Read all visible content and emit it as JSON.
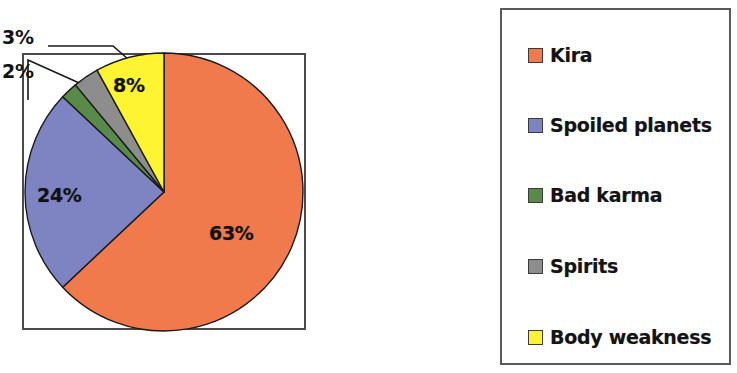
{
  "chart_data": {
    "type": "pie",
    "title": "",
    "subtitle": "",
    "xlabel": "",
    "ylabel": "",
    "legend_position": "right",
    "grid": false,
    "categories": [
      "Kira",
      "Spoiled planets",
      "Bad karma",
      "Spirits",
      "Body weakness"
    ],
    "values": [
      63,
      24,
      2,
      3,
      8
    ],
    "value_labels": [
      "63%",
      "24%",
      "2%",
      "3%",
      "8%"
    ],
    "colors": [
      "#f07a4c",
      "#7e84c2",
      "#5a8a4a",
      "#8d8d8d",
      "#fff432"
    ],
    "units": "percent",
    "slices": [
      {
        "label": "Kira",
        "value": 63,
        "display": "63%",
        "color": "#f07a4c",
        "label_placement": "inside"
      },
      {
        "label": "Spoiled planets",
        "value": 24,
        "display": "24%",
        "color": "#7e84c2",
        "label_placement": "inside"
      },
      {
        "label": "Bad karma",
        "value": 2,
        "display": "2%",
        "color": "#5a8a4a",
        "label_placement": "outside-callout"
      },
      {
        "label": "Spirits",
        "value": 3,
        "display": "3%",
        "color": "#8d8d8d",
        "label_placement": "outside-callout"
      },
      {
        "label": "Body weakness",
        "value": 8,
        "display": "8%",
        "color": "#fff432",
        "label_placement": "inside"
      }
    ]
  },
  "pie": {
    "labels": {
      "kira": "63%",
      "spoiled_planets": "24%",
      "bad_karma": "2%",
      "spirits": "3%",
      "body_weakness": "8%"
    }
  },
  "legend": {
    "items": [
      {
        "label": "Kira",
        "color": "#f07a4c"
      },
      {
        "label": "Spoiled planets",
        "color": "#7e84c2"
      },
      {
        "label": "Bad karma",
        "color": "#5a8a4a"
      },
      {
        "label": "Spirits",
        "color": "#8d8d8d"
      },
      {
        "label": "Body weakness",
        "color": "#fff432"
      }
    ]
  }
}
